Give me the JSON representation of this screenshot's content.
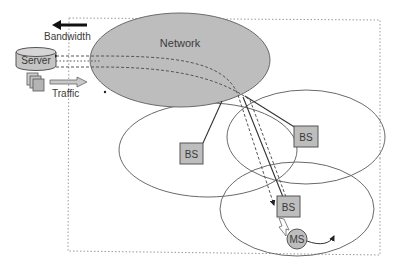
{
  "diagram": {
    "type": "mobile network topology",
    "labels": {
      "bandwidth": "Bandwidth",
      "server": "Server",
      "traffic": "Traffic",
      "network": "Network",
      "bs1": "BS",
      "bs2": "BS",
      "bs3": "BS",
      "ms": "MS"
    },
    "nodes": [
      {
        "id": "server",
        "label": "Server",
        "shape": "cylinder"
      },
      {
        "id": "network",
        "label": "Network",
        "shape": "ellipse"
      },
      {
        "id": "bs1",
        "label": "BS",
        "shape": "square",
        "cell": "left"
      },
      {
        "id": "bs2",
        "label": "BS",
        "shape": "square",
        "cell": "right"
      },
      {
        "id": "bs3",
        "label": "BS",
        "shape": "square",
        "cell": "bottom"
      },
      {
        "id": "ms",
        "label": "MS",
        "shape": "circle"
      }
    ],
    "edges": [
      {
        "from": "network",
        "to": "bs1",
        "style": "solid"
      },
      {
        "from": "network",
        "to": "bs2",
        "style": "solid"
      },
      {
        "from": "network",
        "to": "bs3",
        "style": "solid"
      },
      {
        "from": "server",
        "to": "bs3",
        "style": "dashed",
        "note": "data paths through network"
      },
      {
        "from": "bs3",
        "to": "ms",
        "style": "wireless-link"
      }
    ],
    "colors": {
      "fill_gray": "#bdbdbd",
      "stroke": "#5a5a5a",
      "dotted_border": "#9a9a9a"
    }
  }
}
